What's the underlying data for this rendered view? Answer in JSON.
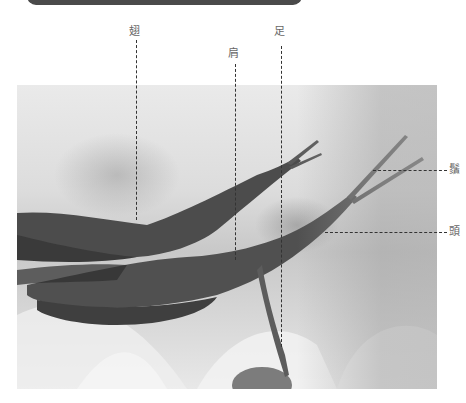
{
  "figure": {
    "labels": {
      "wing": "翅",
      "shoulder": "肩",
      "leg": "足",
      "antennae": "鬚",
      "head": "頭"
    },
    "colors": {
      "top_bar": "#4a4a4a",
      "leader_line": "#333333",
      "label_text": "#666666"
    }
  }
}
